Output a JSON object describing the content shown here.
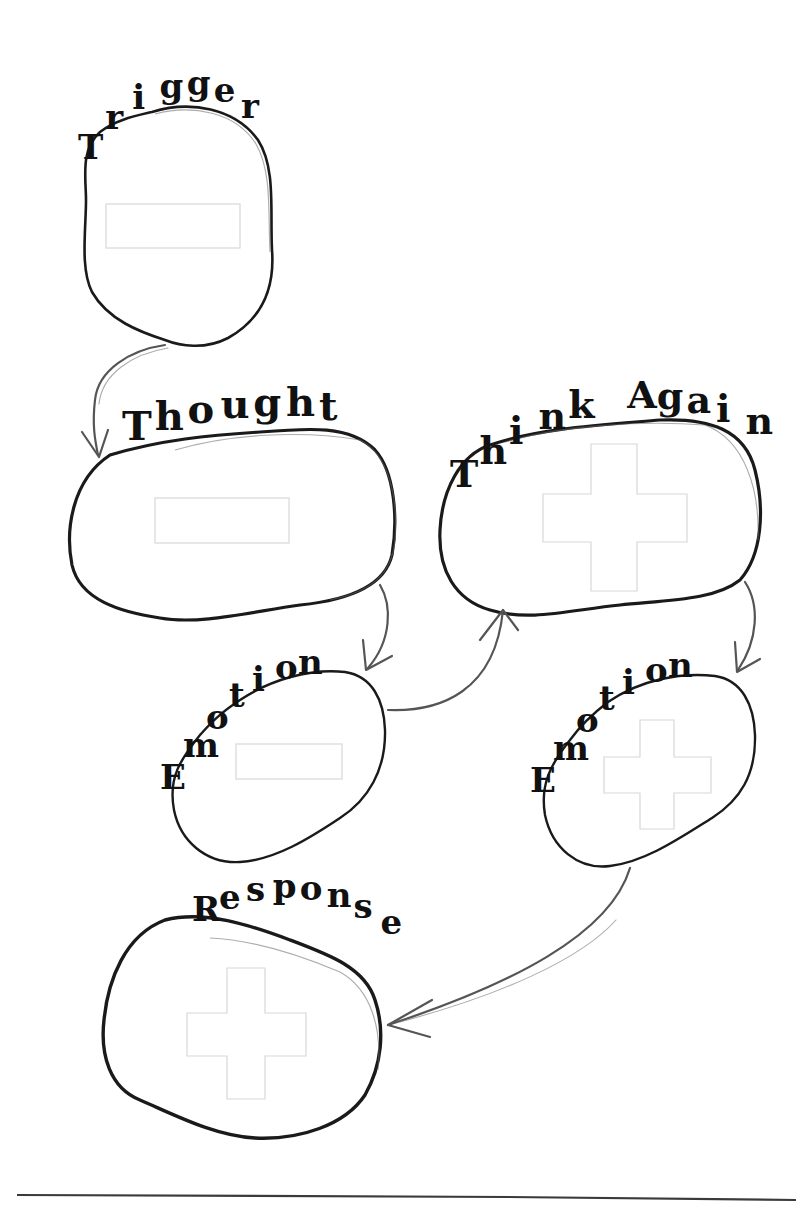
{
  "worksheet": {
    "nodes": [
      {
        "id": "trigger",
        "label": "Trigger",
        "placeholder": "rectangle"
      },
      {
        "id": "thought",
        "label": "Thought",
        "placeholder": "rectangle"
      },
      {
        "id": "think_again",
        "label": "Think Again",
        "placeholder": "plus"
      },
      {
        "id": "emotion_left",
        "label": "Emotion",
        "placeholder": "rectangle"
      },
      {
        "id": "emotion_right",
        "label": "Emotion",
        "placeholder": "plus"
      },
      {
        "id": "response",
        "label": "Response",
        "placeholder": "plus"
      }
    ],
    "edges": [
      {
        "from": "trigger",
        "to": "thought"
      },
      {
        "from": "thought",
        "to": "emotion_left"
      },
      {
        "from": "emotion_left",
        "to": "think_again"
      },
      {
        "from": "think_again",
        "to": "emotion_right"
      },
      {
        "from": "emotion_right",
        "to": "response"
      }
    ]
  },
  "labels": {
    "trigger": "Trigger",
    "thought": "Thought",
    "think_again": "Think Again",
    "emotion_left": "Emotion",
    "emotion_right": "Emotion",
    "response": "Response"
  },
  "colors": {
    "outline": "#1a1a1a",
    "arrow": "#555555",
    "placeholder": "#d8d8d8",
    "background": "#ffffff"
  }
}
